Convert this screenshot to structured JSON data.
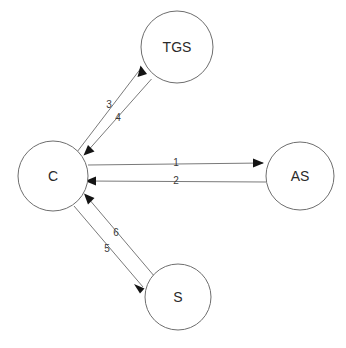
{
  "diagram": {
    "background_color": "#ffffff",
    "node_stroke_color": "#6e6e6e",
    "edge_stroke_color": "#7a7a7a",
    "arrow_fill_color": "#141414",
    "nodes": [
      {
        "id": "tgs",
        "label": "TGS",
        "cx": 177,
        "cy": 47,
        "r": 36
      },
      {
        "id": "c",
        "label": "C",
        "cx": 53,
        "cy": 176,
        "r": 35
      },
      {
        "id": "as",
        "label": "AS",
        "cx": 300,
        "cy": 176,
        "r": 34
      },
      {
        "id": "s",
        "label": "S",
        "cx": 178,
        "cy": 297,
        "r": 33
      }
    ],
    "edges": [
      {
        "id": "edge-1",
        "label": "1",
        "from": "c",
        "to": "as",
        "label_x": 176,
        "label_y": 163
      },
      {
        "id": "edge-2",
        "label": "2",
        "from": "as",
        "to": "c",
        "label_x": 176,
        "label_y": 181
      },
      {
        "id": "edge-3",
        "label": "3",
        "from": "c",
        "to": "tgs",
        "label_x": 109,
        "label_y": 105
      },
      {
        "id": "edge-4",
        "label": "4",
        "from": "tgs",
        "to": "c",
        "label_x": 118,
        "label_y": 118
      },
      {
        "id": "edge-5",
        "label": "5",
        "from": "c",
        "to": "s",
        "label_x": 107,
        "label_y": 249
      },
      {
        "id": "edge-6",
        "label": "6",
        "from": "s",
        "to": "c",
        "label_x": 116,
        "label_y": 233
      }
    ]
  }
}
